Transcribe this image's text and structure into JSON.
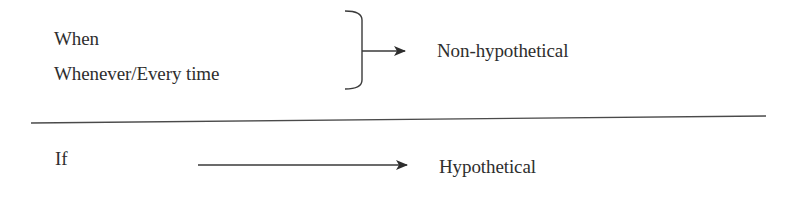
{
  "diagram": {
    "top_group": {
      "conditions": [
        "When",
        "Whenever/Every time"
      ],
      "result": "Non-hypothetical",
      "connector": "brace-arrow"
    },
    "bottom_group": {
      "conditions": [
        "If"
      ],
      "result": "Hypothetical",
      "connector": "arrow"
    },
    "separator": "horizontal-rule",
    "colors": {
      "ink": "#2e2e2e",
      "background": "#ffffff"
    }
  }
}
